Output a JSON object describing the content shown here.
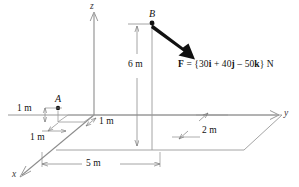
{
  "figure": {
    "type": "engineering-statics-3d-force-diagram",
    "background_color": "#ffffff",
    "line_color": "#808080",
    "bold_color": "#111111"
  },
  "axes": {
    "x_label": "x",
    "y_label": "y",
    "z_label": "z"
  },
  "points": {
    "a_label": "A",
    "b_label": "B"
  },
  "force": {
    "text": "F = {30i + 40j – 50k} N",
    "symbol": "F",
    "equals": " = {",
    "i_coeff": "30",
    "i_unit": "i",
    "plus": " + ",
    "j_coeff": "40",
    "j_unit": "j",
    "minus": " – ",
    "k_coeff": "50",
    "k_unit": "k",
    "close": "} N",
    "components": {
      "i": 30,
      "j": 40,
      "k": -50,
      "units": "N"
    }
  },
  "dimensions": {
    "height_b": "6 m",
    "length_base": "5 m",
    "depth_right": "2 m",
    "a_height": "1 m",
    "a_offset_y": "1 m",
    "a_offset_x": "1 m"
  }
}
